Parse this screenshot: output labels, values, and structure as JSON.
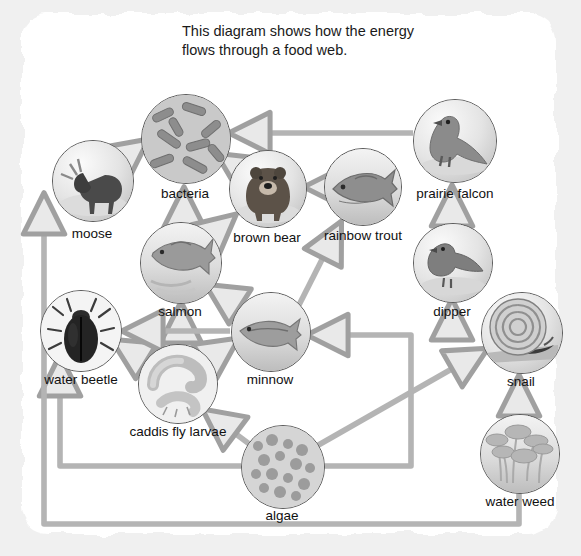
{
  "page": {
    "title_line1": "This diagram shows how the energy",
    "title_line2": "flows through a food web.",
    "background_color": "#f0f0f0",
    "paper_color": "#ffffff",
    "arrow_color": "#9a9a9a",
    "label_color": "#111111"
  },
  "diagram": {
    "type": "food-web",
    "nodes": [
      {
        "id": "moose",
        "label": "moose",
        "cx": 92,
        "cy": 180,
        "r": 40,
        "icon": "moose-icon"
      },
      {
        "id": "bacteria",
        "label": "bacteria",
        "cx": 185,
        "cy": 138,
        "r": 44,
        "icon": "bacteria-icon"
      },
      {
        "id": "brown_bear",
        "label": "brown bear",
        "cx": 267,
        "cy": 188,
        "r": 38,
        "icon": "bear-icon"
      },
      {
        "id": "rainbow_trout",
        "label": "rainbow trout",
        "cx": 362,
        "cy": 186,
        "r": 38,
        "icon": "trout-icon"
      },
      {
        "id": "prairie_falcon",
        "label": "prairie falcon",
        "cx": 454,
        "cy": 140,
        "r": 41,
        "icon": "falcon-icon"
      },
      {
        "id": "dipper",
        "label": "dipper",
        "cx": 452,
        "cy": 262,
        "r": 39,
        "icon": "dipper-icon"
      },
      {
        "id": "salmon",
        "label": "salmon",
        "cx": 180,
        "cy": 262,
        "r": 40,
        "icon": "salmon-icon"
      },
      {
        "id": "snail",
        "label": "snail",
        "cx": 521,
        "cy": 332,
        "r": 40,
        "icon": "snail-icon"
      },
      {
        "id": "minnow",
        "label": "minnow",
        "cx": 269,
        "cy": 330,
        "r": 39,
        "icon": "minnow-icon"
      },
      {
        "id": "water_beetle",
        "label": "water beetle",
        "cx": 80,
        "cy": 330,
        "r": 40,
        "icon": "beetle-icon"
      },
      {
        "id": "caddis_fly_larvae",
        "label": "caddis fly larvae",
        "cx": 177,
        "cy": 383,
        "r": 39,
        "icon": "caddis-icon"
      },
      {
        "id": "algae",
        "label": "algae",
        "cx": 282,
        "cy": 466,
        "r": 41,
        "icon": "algae-icon"
      },
      {
        "id": "water_weed",
        "label": "water weed",
        "cx": 519,
        "cy": 453,
        "r": 39,
        "icon": "waterweed-icon"
      }
    ],
    "edges": [
      {
        "from": "moose",
        "to": "bacteria"
      },
      {
        "from": "brown_bear",
        "to": "bacteria"
      },
      {
        "from": "prairie_falcon",
        "to": "bacteria"
      },
      {
        "from": "salmon",
        "to": "bacteria"
      },
      {
        "from": "rainbow_trout",
        "to": "brown_bear"
      },
      {
        "from": "salmon",
        "to": "brown_bear"
      },
      {
        "from": "dipper",
        "to": "prairie_falcon"
      },
      {
        "from": "minnow",
        "to": "rainbow_trout"
      },
      {
        "from": "minnow",
        "to": "salmon"
      },
      {
        "from": "snail",
        "to": "dipper"
      },
      {
        "from": "caddis_fly_larvae",
        "to": "salmon"
      },
      {
        "from": "caddis_fly_larvae",
        "to": "minnow"
      },
      {
        "from": "caddis_fly_larvae",
        "to": "water_beetle"
      },
      {
        "from": "minnow",
        "to": "water_beetle"
      },
      {
        "from": "algae",
        "to": "caddis_fly_larvae"
      },
      {
        "from": "algae",
        "to": "minnow"
      },
      {
        "from": "algae",
        "to": "snail"
      },
      {
        "from": "algae",
        "to": "water_beetle"
      },
      {
        "from": "water_weed",
        "to": "snail"
      },
      {
        "from": "water_weed",
        "to": "moose"
      }
    ]
  }
}
